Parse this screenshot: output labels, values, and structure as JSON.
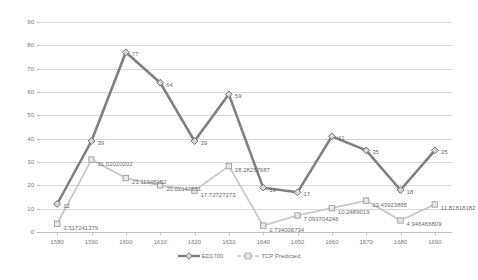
{
  "chart_data": {
    "type": "line",
    "title": "",
    "xlabel": "",
    "ylabel": "",
    "ylim": [
      0,
      90
    ],
    "ytick_step": 10,
    "grid": true,
    "legend_position": "bottom",
    "categories": [
      1580,
      1590,
      1600,
      1610,
      1620,
      1630,
      1640,
      1650,
      1660,
      1670,
      1680,
      1690
    ],
    "xtick_labels": [
      "1580",
      "1590",
      "1600",
      "1610",
      "1620",
      "1630",
      "1640",
      "1650",
      "1660",
      "1670",
      "1680",
      "1690"
    ],
    "ytick_labels": [
      "0",
      "10",
      "20",
      "30",
      "40",
      "50",
      "60",
      "70",
      "80",
      "90"
    ],
    "series": [
      {
        "name": "ED1700",
        "color": "#808080",
        "marker": "diamond",
        "values": [
          12,
          39,
          77,
          64,
          39,
          59,
          19,
          17,
          41,
          35,
          18,
          35
        ],
        "labels": [
          "12",
          "39",
          "77",
          "64",
          "39",
          "59",
          "19",
          "17",
          "41",
          "35",
          "18",
          "35"
        ]
      },
      {
        "name": "TCP Predicted",
        "color": "#c8c8c8",
        "marker": "square",
        "values": [
          3.517241379,
          31.02020202,
          23.11948052,
          20.02147651,
          17.72727273,
          28.28257687,
          2.734006734,
          7.093704246,
          10.2489019,
          13.43923865,
          4.946466809,
          11.81818182
        ],
        "labels": [
          "3.517241379",
          "31.02020202",
          "23.11948052",
          "20.02147651",
          "17.72727273",
          "28.28257687",
          "2.734006734",
          "7.093704246",
          "10.2489019",
          "13.43923865",
          "4.946466809",
          "11.81818182"
        ]
      }
    ]
  },
  "legend": {
    "items": [
      {
        "label": "ED1700"
      },
      {
        "label": "TCP Predicted"
      }
    ]
  }
}
